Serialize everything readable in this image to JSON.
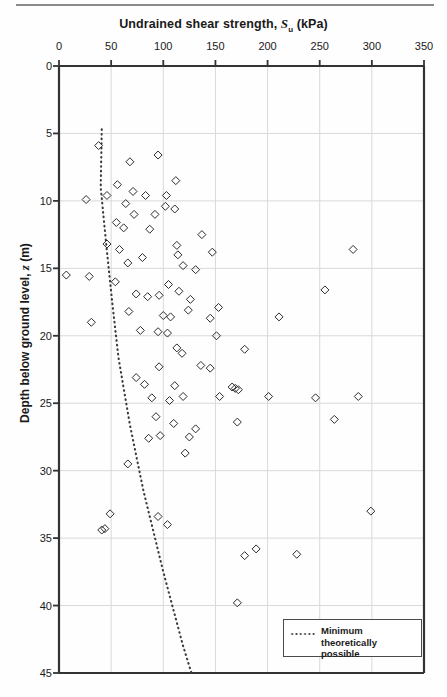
{
  "chart_data": {
    "type": "scatter",
    "title": "Undrained shear strength, Su (kPa)",
    "title_main": "Undrained shear strength, ",
    "title_symbol": "S",
    "title_symbol_sub": "u",
    "title_units": " (kPa)",
    "xlabel": "Undrained shear strength, Su (kPa)",
    "ylabel": "Depth below ground level, z (m)",
    "ylabel_main": "Depth below ground level, ",
    "ylabel_symbol": "z",
    "ylabel_units": " (m)",
    "xlim": [
      0,
      350
    ],
    "ylim": [
      0,
      45
    ],
    "y_inverted": true,
    "x_ticks": [
      0,
      50,
      100,
      150,
      200,
      250,
      300,
      350
    ],
    "y_ticks": [
      0,
      5,
      10,
      15,
      20,
      25,
      30,
      35,
      40,
      45
    ],
    "x_axis_position": "top",
    "grid": true,
    "grid_color": "#d9d9d9",
    "marker": "open-diamond",
    "marker_color": "#2b2b2b",
    "legend_position": "bottom-right",
    "legend": [
      {
        "label": "Minimum theoretically possible",
        "style": "dotted-line",
        "color": "#3c3c3c"
      }
    ],
    "series": [
      {
        "name": "Measured undrained shear strength",
        "marker": "open-diamond",
        "points": [
          [
            38,
            5.9
          ],
          [
            26,
            9.9
          ],
          [
            68,
            7.1
          ],
          [
            95,
            6.6
          ],
          [
            56,
            8.8
          ],
          [
            46,
            9.6
          ],
          [
            71,
            9.3
          ],
          [
            64,
            10.2
          ],
          [
            83,
            9.6
          ],
          [
            103,
            9.6
          ],
          [
            112,
            8.5
          ],
          [
            72,
            11.0
          ],
          [
            92,
            11.0
          ],
          [
            102,
            10.4
          ],
          [
            111,
            10.6
          ],
          [
            62,
            12.0
          ],
          [
            87,
            12.1
          ],
          [
            137,
            12.5
          ],
          [
            55,
            11.6
          ],
          [
            46,
            13.2
          ],
          [
            58,
            13.6
          ],
          [
            7,
            15.5
          ],
          [
            29,
            15.6
          ],
          [
            66,
            14.6
          ],
          [
            80,
            14.2
          ],
          [
            113,
            13.3
          ],
          [
            114,
            14.0
          ],
          [
            119,
            14.8
          ],
          [
            131,
            15.1
          ],
          [
            147,
            13.8
          ],
          [
            105,
            16.2
          ],
          [
            115,
            16.7
          ],
          [
            126,
            17.3
          ],
          [
            54,
            16.0
          ],
          [
            74,
            16.9
          ],
          [
            85,
            17.1
          ],
          [
            96,
            17.0
          ],
          [
            282,
            13.6
          ],
          [
            67,
            18.2
          ],
          [
            100,
            18.5
          ],
          [
            107,
            18.6
          ],
          [
            124,
            18.1
          ],
          [
            153,
            17.9
          ],
          [
            31,
            19.0
          ],
          [
            78,
            19.6
          ],
          [
            95,
            19.7
          ],
          [
            104,
            19.8
          ],
          [
            145,
            18.7
          ],
          [
            151,
            20.0
          ],
          [
            211,
            18.6
          ],
          [
            255,
            16.6
          ],
          [
            113,
            20.9
          ],
          [
            118,
            21.3
          ],
          [
            136,
            22.2
          ],
          [
            145,
            22.4
          ],
          [
            178,
            21.0
          ],
          [
            96,
            22.3
          ],
          [
            74,
            23.1
          ],
          [
            82,
            23.6
          ],
          [
            111,
            23.7
          ],
          [
            89,
            24.6
          ],
          [
            106,
            24.8
          ],
          [
            119,
            24.5
          ],
          [
            166,
            23.8
          ],
          [
            169,
            23.9
          ],
          [
            172,
            24.0
          ],
          [
            154,
            24.5
          ],
          [
            201,
            24.5
          ],
          [
            246,
            24.6
          ],
          [
            287,
            24.5
          ],
          [
            93,
            26.0
          ],
          [
            110,
            26.5
          ],
          [
            131,
            26.9
          ],
          [
            171,
            26.4
          ],
          [
            264,
            26.2
          ],
          [
            86,
            27.6
          ],
          [
            97,
            27.4
          ],
          [
            125,
            27.5
          ],
          [
            121,
            28.7
          ],
          [
            66,
            29.5
          ],
          [
            49,
            33.2
          ],
          [
            41,
            34.4
          ],
          [
            44,
            34.3
          ],
          [
            95,
            33.4
          ],
          [
            104,
            34.0
          ],
          [
            189,
            35.8
          ],
          [
            299,
            33.0
          ],
          [
            178,
            36.3
          ],
          [
            228,
            36.2
          ],
          [
            171,
            39.8
          ]
        ]
      }
    ],
    "trend_line": {
      "name": "Minimum theoretically possible",
      "style": "dotted",
      "color": "#3c3c3c",
      "points": [
        [
          41,
          4.7
        ],
        [
          40,
          9.0
        ],
        [
          45,
          13.0
        ],
        [
          51,
          17.5
        ],
        [
          57,
          21.6
        ],
        [
          68,
          26.6
        ],
        [
          81,
          31.5
        ],
        [
          100,
          37.5
        ],
        [
          119,
          43.0
        ],
        [
          127,
          45.0
        ]
      ]
    }
  }
}
